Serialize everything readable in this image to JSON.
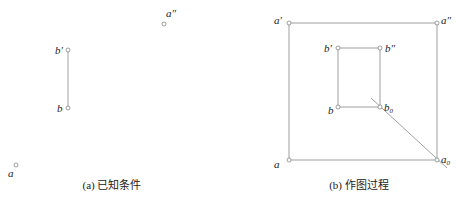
{
  "figure_a": {
    "caption": "(a) 已知条件",
    "labels": {
      "a_double_prime": "a″",
      "b_prime": "b′",
      "b": "b",
      "a": "a"
    }
  },
  "figure_b": {
    "caption": "(b) 作图过程",
    "labels": {
      "a_prime": "a′",
      "a_double_prime": "a″",
      "b_prime": "b′",
      "b_double_prime": "b″",
      "b": "b",
      "b0_base": "b",
      "b0_sub": "0",
      "a": "a",
      "a0_base": "a",
      "a0_sub": "0"
    }
  }
}
